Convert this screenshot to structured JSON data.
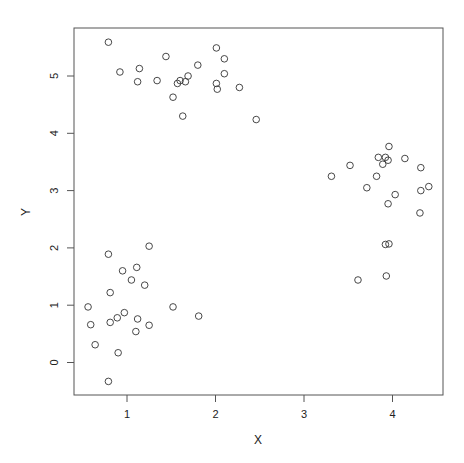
{
  "chart_data": {
    "type": "scatter",
    "title": "",
    "xlabel": "X",
    "ylabel": "Y",
    "xlim": [
      0.47,
      4.63
    ],
    "ylim": [
      -0.52,
      5.9
    ],
    "xticks": [
      1,
      2,
      3,
      4
    ],
    "yticks": [
      0,
      1,
      2,
      3,
      4,
      5
    ],
    "xtick_labels": [
      "1",
      "2",
      "3",
      "4"
    ],
    "ytick_labels": [
      "0",
      "1",
      "2",
      "3",
      "4",
      "5"
    ],
    "grid": false,
    "legend": null,
    "marker": "open-circle",
    "marker_color": "#333333",
    "frame_color": "#555555",
    "series": [
      {
        "name": "cluster-top",
        "points": [
          [
            0.79,
            5.59
          ],
          [
            0.92,
            5.07
          ],
          [
            1.12,
            4.9
          ],
          [
            1.14,
            5.13
          ],
          [
            1.34,
            4.92
          ],
          [
            1.44,
            5.34
          ],
          [
            1.57,
            4.87
          ],
          [
            1.6,
            4.92
          ],
          [
            1.66,
            4.9
          ],
          [
            1.69,
            5.0
          ],
          [
            1.52,
            4.63
          ],
          [
            1.63,
            4.3
          ],
          [
            1.8,
            5.19
          ],
          [
            2.01,
            5.49
          ],
          [
            2.01,
            4.87
          ],
          [
            2.02,
            4.77
          ],
          [
            2.1,
            5.3
          ],
          [
            2.1,
            5.04
          ],
          [
            2.27,
            4.8
          ],
          [
            2.46,
            4.24
          ]
        ]
      },
      {
        "name": "cluster-bottom",
        "points": [
          [
            0.79,
            1.89
          ],
          [
            1.25,
            2.03
          ],
          [
            0.95,
            1.6
          ],
          [
            1.11,
            1.66
          ],
          [
            1.05,
            1.44
          ],
          [
            1.2,
            1.35
          ],
          [
            0.81,
            1.22
          ],
          [
            0.56,
            0.97
          ],
          [
            1.52,
            0.97
          ],
          [
            1.81,
            0.81
          ],
          [
            0.59,
            0.66
          ],
          [
            0.81,
            0.7
          ],
          [
            0.89,
            0.78
          ],
          [
            0.97,
            0.87
          ],
          [
            1.12,
            0.76
          ],
          [
            1.25,
            0.65
          ],
          [
            1.1,
            0.54
          ],
          [
            0.64,
            0.31
          ],
          [
            0.9,
            0.17
          ],
          [
            0.79,
            -0.33
          ]
        ]
      },
      {
        "name": "cluster-right",
        "points": [
          [
            3.96,
            3.77
          ],
          [
            3.84,
            3.58
          ],
          [
            3.92,
            3.58
          ],
          [
            3.95,
            3.53
          ],
          [
            3.89,
            3.46
          ],
          [
            4.14,
            3.56
          ],
          [
            3.52,
            3.44
          ],
          [
            4.32,
            3.4
          ],
          [
            3.31,
            3.25
          ],
          [
            3.82,
            3.25
          ],
          [
            3.71,
            3.05
          ],
          [
            4.41,
            3.07
          ],
          [
            4.32,
            3.0
          ],
          [
            4.03,
            2.93
          ],
          [
            3.95,
            2.77
          ],
          [
            4.31,
            2.61
          ],
          [
            3.92,
            2.06
          ],
          [
            3.96,
            2.07
          ],
          [
            3.93,
            1.51
          ],
          [
            3.61,
            1.44
          ]
        ]
      }
    ]
  }
}
